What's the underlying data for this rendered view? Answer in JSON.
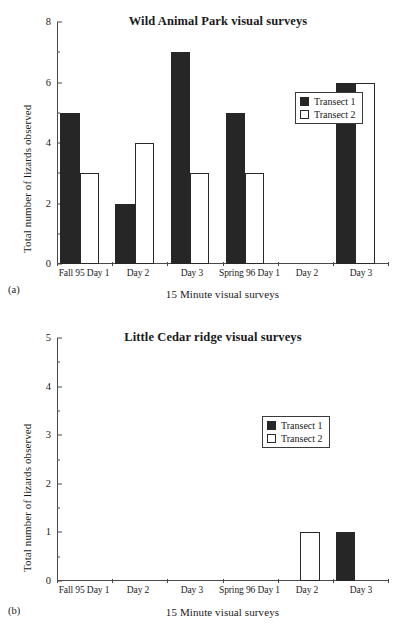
{
  "figures": [
    {
      "panel_label": "(a)",
      "title": "Wild Animal Park visual surveys",
      "ylabel": "Total number of lizards observed",
      "xlabel": "15 Minute visual surveys",
      "legend": [
        {
          "label": "Transect 1",
          "style": "filled"
        },
        {
          "label": "Transect 2",
          "style": "open"
        }
      ],
      "yticks_major": [
        "0",
        "2",
        "4",
        "6",
        "8"
      ],
      "categories": [
        "Fall 95 Day 1",
        "Day 2",
        "Day 3",
        "Spring 96 Day 1",
        "Day 2",
        "Day 3"
      ]
    },
    {
      "panel_label": "(b)",
      "title": "Little Cedar ridge visual surveys",
      "ylabel": "Total number of lizards observed",
      "xlabel": "15 Minute visual surveys",
      "legend": [
        {
          "label": "Transect 1",
          "style": "filled"
        },
        {
          "label": "Transect 2",
          "style": "open"
        }
      ],
      "yticks_major": [
        "0",
        "1",
        "2",
        "3",
        "4",
        "5"
      ],
      "categories": [
        "Fall 95 Day 1",
        "Day 2",
        "Day 3",
        "Spring 96 Day 1",
        "Day 2",
        "Day 3"
      ]
    }
  ],
  "chart_data": [
    {
      "type": "bar",
      "title": "Wild Animal Park visual surveys",
      "panel": "(a)",
      "xlabel": "15 Minute visual surveys",
      "ylabel": "Total number of lizards observed",
      "categories": [
        "Fall 95 Day 1",
        "Day 2",
        "Day 3",
        "Spring 96 Day 1",
        "Day 2",
        "Day 3"
      ],
      "series": [
        {
          "name": "Transect 1",
          "values": [
            5,
            2,
            7,
            5,
            0,
            6
          ],
          "fill": "#262626"
        },
        {
          "name": "Transect 2",
          "values": [
            3,
            4,
            3,
            3,
            0,
            6
          ],
          "fill": "#ffffff"
        }
      ],
      "ylim": [
        0,
        8
      ],
      "ytick_step": 2,
      "yminor_step": 1,
      "grid": false,
      "legend_position": "upper right"
    },
    {
      "type": "bar",
      "title": "Little Cedar ridge visual surveys",
      "panel": "(b)",
      "xlabel": "15 Minute visual surveys",
      "ylabel": "Total number of lizards observed",
      "categories": [
        "Fall 95 Day 1",
        "Day 2",
        "Day 3",
        "Spring 96 Day 1",
        "Day 2",
        "Day 3"
      ],
      "series": [
        {
          "name": "Transect 1",
          "values": [
            0,
            0,
            0,
            0,
            0,
            1
          ],
          "fill": "#262626"
        },
        {
          "name": "Transect 2",
          "values": [
            0,
            0,
            0,
            0,
            1,
            0
          ],
          "fill": "#ffffff"
        }
      ],
      "ylim": [
        0,
        5
      ],
      "ytick_step": 1,
      "yminor_step": 0.5,
      "grid": false,
      "legend_position": "upper center"
    }
  ]
}
